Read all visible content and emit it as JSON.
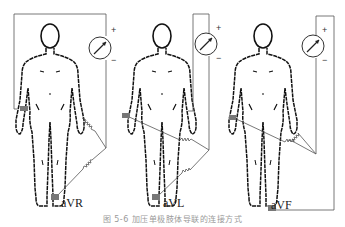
{
  "figure": {
    "panels": [
      {
        "id": "avr",
        "lead_label": "aVR",
        "meter_plus": "+",
        "meter_minus": "−"
      },
      {
        "id": "avl",
        "lead_label": "aVL",
        "meter_plus": "+",
        "meter_minus": "−"
      },
      {
        "id": "avf",
        "lead_label": "aVF",
        "meter_plus": "+",
        "meter_minus": "−"
      }
    ],
    "caption": "图 5-6  加压单极肢体导联的连接方式",
    "colors": {
      "wire": "#555555",
      "body_outline": "#111111",
      "electrode": "#777777",
      "background": "#ffffff"
    }
  }
}
